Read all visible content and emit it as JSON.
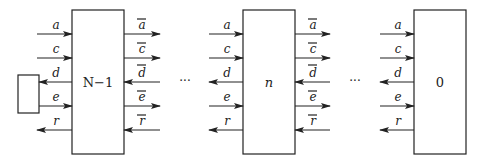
{
  "diagram": {
    "type": "cascade of processing blocks",
    "blocks": [
      {
        "label": "N−1",
        "position": "left"
      },
      {
        "label": "n",
        "position": "middle"
      },
      {
        "label": "0",
        "position": "right"
      }
    ],
    "external_box": {
      "label": "",
      "connects": [
        "d",
        "e"
      ]
    },
    "signals_left": [
      {
        "name": "a",
        "direction": "in"
      },
      {
        "name": "c",
        "direction": "in"
      },
      {
        "name": "d",
        "direction": "out"
      },
      {
        "name": "e",
        "direction": "in"
      },
      {
        "name": "r",
        "direction": "out"
      }
    ],
    "signals_right": [
      {
        "name": "a",
        "bar": true,
        "direction": "out"
      },
      {
        "name": "c",
        "bar": true,
        "direction": "out"
      },
      {
        "name": "d",
        "bar": true,
        "direction": "in"
      },
      {
        "name": "e",
        "bar": true,
        "direction": "out"
      },
      {
        "name": "r",
        "bar": true,
        "direction": "in"
      }
    ],
    "ellipsis": "···"
  }
}
